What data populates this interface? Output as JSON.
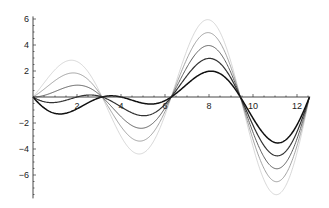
{
  "chart_data": {
    "type": "line",
    "title": "",
    "xlabel": "",
    "ylabel": "",
    "xlim": [
      0,
      12.6
    ],
    "ylim": [
      -7.8,
      6.2
    ],
    "grid": false,
    "legend": "none",
    "function_family": "sin(x) * (0.5*x + c)",
    "x_ticks": [
      2,
      4,
      6,
      8,
      10,
      12
    ],
    "x_tick_labels": [
      "2",
      "4",
      "6",
      "8",
      "10",
      "12"
    ],
    "y_ticks": [
      -6,
      -4,
      -2,
      2,
      4,
      6
    ],
    "y_tick_labels": [
      "-6",
      "-4",
      "-2",
      "2",
      "4",
      "6"
    ],
    "x_domain": [
      0,
      12.566
    ],
    "series": [
      {
        "name": "c=2",
        "c": 2,
        "color": "#bdbdbd",
        "peaks": [
          2.8,
          -4.4,
          5.8,
          -7.4
        ]
      },
      {
        "name": "c=1",
        "c": 1,
        "color": "#8c8c8c",
        "peaks": [
          1.8,
          -3.5,
          4.8,
          -6.4
        ]
      },
      {
        "name": "c=0",
        "c": 0,
        "color": "#5e5e5e",
        "peaks": [
          0.9,
          -2.6,
          3.9,
          -5.5
        ]
      },
      {
        "name": "c=-1",
        "c": -1,
        "color": "#333333",
        "peaks": [
          -0.2,
          -1.8,
          2.9,
          -4.5
        ]
      },
      {
        "name": "c=-2",
        "c": -2,
        "color": "#111111",
        "peaks": [
          -1.3,
          -0.3,
          1.9,
          -3.5
        ]
      }
    ]
  }
}
